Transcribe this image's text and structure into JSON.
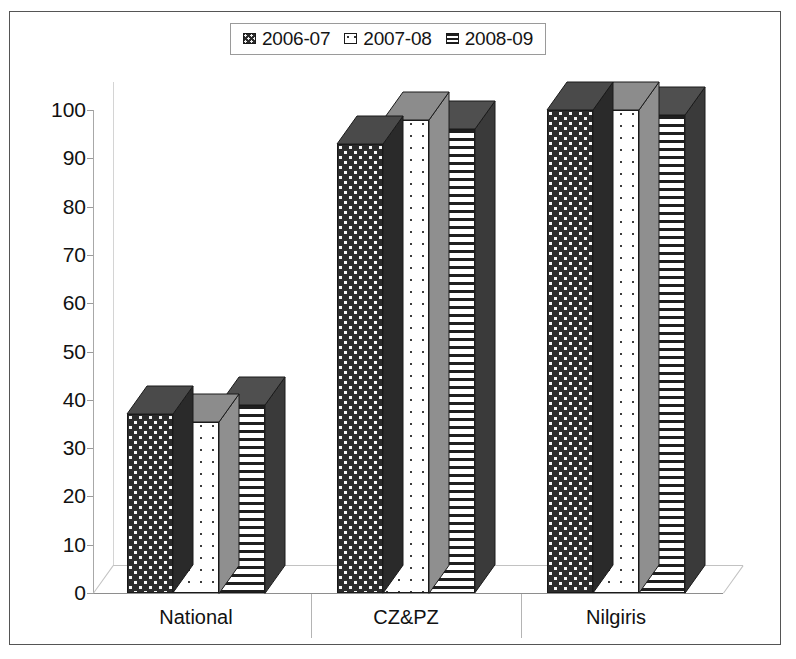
{
  "legend": {
    "position": "top-center",
    "items": [
      {
        "label": "2006-07",
        "key": "checker-dark-pattern"
      },
      {
        "label": "2007-08",
        "key": "dotted-light-pattern"
      },
      {
        "label": "2008-09",
        "key": "horizontal-lines-pattern"
      }
    ]
  },
  "axis": {
    "y_ticks": [
      "100",
      "90",
      "80",
      "70",
      "60",
      "50",
      "40",
      "30",
      "20",
      "10",
      "0"
    ],
    "x_ticks": [
      "National",
      "CZ&PZ",
      "Nilgiris"
    ]
  },
  "colors": {
    "series_2006_07": "#2b2b2b",
    "series_2007_08": "#ffffff",
    "series_2008_09": "#1f1f1f",
    "frame": "#555555",
    "axis": "#9b9b9b",
    "text": "#111111"
  },
  "chart_data": {
    "type": "bar",
    "title": "",
    "subtitle": "",
    "xlabel": "",
    "ylabel": "",
    "ylim": [
      0,
      100
    ],
    "ytick_step": 10,
    "grid": false,
    "legend_position": "top-center",
    "style": "3d-clustered-column",
    "categories": [
      "National",
      "CZ&PZ",
      "Nilgiris"
    ],
    "series": [
      {
        "name": "2006-07",
        "values": [
          37,
          93,
          100
        ]
      },
      {
        "name": "2007-08",
        "values": [
          35.5,
          98,
          100
        ]
      },
      {
        "name": "2008-09",
        "values": [
          39,
          96,
          99
        ]
      }
    ]
  }
}
